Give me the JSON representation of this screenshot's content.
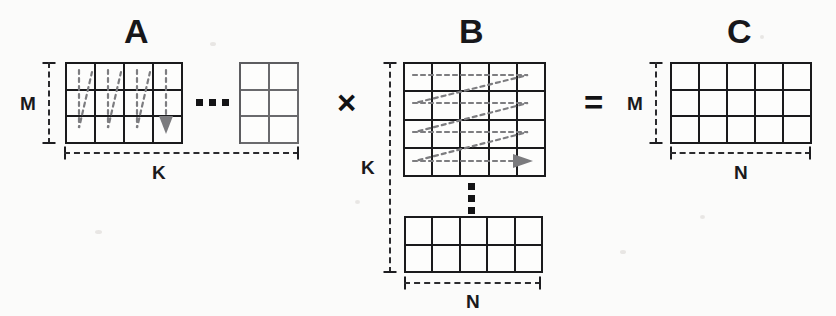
{
  "figure": {
    "background_color": "#fbfbfa",
    "ink_color": "#1a1a1c"
  },
  "matrices": {
    "a": {
      "label": "A",
      "row_dim_label": "M",
      "col_dim_label": "K",
      "block_main": {
        "rows": 3,
        "cols": 4
      },
      "block_tail": {
        "rows": 3,
        "cols": 2
      },
      "traversal": "column-major",
      "continuation": "horizontal-ellipsis"
    },
    "b": {
      "label": "B",
      "row_dim_label": "K",
      "col_dim_label": "N",
      "block_main": {
        "rows": 4,
        "cols": 5
      },
      "block_tail": {
        "rows": 2,
        "cols": 5
      },
      "traversal": "row-major",
      "continuation": "vertical-ellipsis"
    },
    "c": {
      "label": "C",
      "row_dim_label": "M",
      "col_dim_label": "N",
      "block_main": {
        "rows": 3,
        "cols": 5
      },
      "traversal": "none",
      "continuation": "none"
    }
  },
  "operators": {
    "multiply": "×",
    "equals": "="
  },
  "ellipsis": {
    "horizontal_dots": 3,
    "vertical_dots": 3
  }
}
